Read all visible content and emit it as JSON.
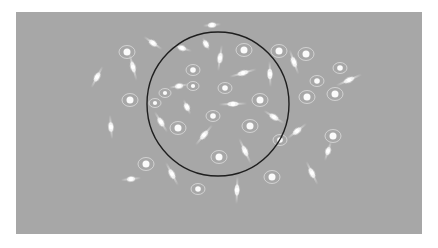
{
  "figure": {
    "background_color": "#a7a7a7",
    "page_color": "#ffffff",
    "frame": {
      "x": 16,
      "y": 12,
      "width": 406,
      "height": 222
    },
    "circle": {
      "cx": 218,
      "cy": 104,
      "rx": 71,
      "ry": 72,
      "stroke": "#1e1e1e",
      "stroke_width": 1.4
    },
    "spindle_cells": [
      {
        "x": 97,
        "y": 77,
        "angle": -62,
        "length": 24
      },
      {
        "x": 133,
        "y": 67,
        "angle": 75,
        "length": 28
      },
      {
        "x": 153,
        "y": 43,
        "angle": 35,
        "length": 22
      },
      {
        "x": 182,
        "y": 48,
        "angle": 18,
        "length": 20
      },
      {
        "x": 212,
        "y": 25,
        "angle": -5,
        "length": 18
      },
      {
        "x": 206,
        "y": 44,
        "angle": 62,
        "length": 14
      },
      {
        "x": 220,
        "y": 58,
        "angle": -82,
        "length": 26
      },
      {
        "x": 243,
        "y": 73,
        "angle": -16,
        "length": 28
      },
      {
        "x": 270,
        "y": 74,
        "angle": 88,
        "length": 26
      },
      {
        "x": 294,
        "y": 62,
        "angle": 70,
        "length": 26
      },
      {
        "x": 349,
        "y": 80,
        "angle": -24,
        "length": 28
      },
      {
        "x": 179,
        "y": 86,
        "angle": -10,
        "length": 20
      },
      {
        "x": 233,
        "y": 104,
        "angle": -2,
        "length": 28
      },
      {
        "x": 274,
        "y": 117,
        "angle": 32,
        "length": 24
      },
      {
        "x": 297,
        "y": 131,
        "angle": -38,
        "length": 24
      },
      {
        "x": 328,
        "y": 151,
        "angle": -72,
        "length": 20
      },
      {
        "x": 204,
        "y": 135,
        "angle": -50,
        "length": 26
      },
      {
        "x": 161,
        "y": 122,
        "angle": 58,
        "length": 24
      },
      {
        "x": 111,
        "y": 127,
        "angle": 85,
        "length": 24
      },
      {
        "x": 245,
        "y": 151,
        "angle": 65,
        "length": 28
      },
      {
        "x": 172,
        "y": 174,
        "angle": 62,
        "length": 26
      },
      {
        "x": 237,
        "y": 190,
        "angle": -88,
        "length": 28
      },
      {
        "x": 131,
        "y": 179,
        "angle": -6,
        "length": 20
      },
      {
        "x": 312,
        "y": 173,
        "angle": 64,
        "length": 26
      },
      {
        "x": 187,
        "y": 107,
        "angle": 65,
        "length": 16
      }
    ],
    "round_cells": [
      {
        "x": 127,
        "y": 52,
        "r": 5
      },
      {
        "x": 130,
        "y": 100,
        "r": 5
      },
      {
        "x": 244,
        "y": 50,
        "r": 5
      },
      {
        "x": 279,
        "y": 51,
        "r": 5
      },
      {
        "x": 306,
        "y": 54,
        "r": 5
      },
      {
        "x": 307,
        "y": 97,
        "r": 5
      },
      {
        "x": 260,
        "y": 100,
        "r": 5
      },
      {
        "x": 335,
        "y": 94,
        "r": 5
      },
      {
        "x": 340,
        "y": 68,
        "r": 4
      },
      {
        "x": 317,
        "y": 81,
        "r": 4
      },
      {
        "x": 193,
        "y": 70,
        "r": 4
      },
      {
        "x": 225,
        "y": 88,
        "r": 4
      },
      {
        "x": 250,
        "y": 126,
        "r": 5
      },
      {
        "x": 213,
        "y": 116,
        "r": 4
      },
      {
        "x": 178,
        "y": 128,
        "r": 5
      },
      {
        "x": 193,
        "y": 86,
        "r": 3
      },
      {
        "x": 219,
        "y": 157,
        "r": 5
      },
      {
        "x": 146,
        "y": 164,
        "r": 5
      },
      {
        "x": 198,
        "y": 189,
        "r": 4
      },
      {
        "x": 272,
        "y": 177,
        "r": 5
      },
      {
        "x": 333,
        "y": 136,
        "r": 5
      },
      {
        "x": 165,
        "y": 93,
        "r": 3
      },
      {
        "x": 280,
        "y": 140,
        "r": 4
      },
      {
        "x": 155,
        "y": 103,
        "r": 3
      }
    ]
  }
}
